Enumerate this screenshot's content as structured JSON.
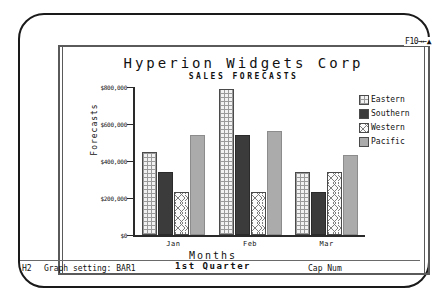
{
  "fkey_hint": "F10→←▲",
  "chart_data": {
    "type": "bar",
    "title": "Hyperion  Widgets  Corp",
    "subtitle": "SALES  FORECASTS",
    "xlabel": "Months",
    "xsublabel": "1st Quarter",
    "ylabel": "Forecasts",
    "categories": [
      "Jan",
      "Feb",
      "Mar"
    ],
    "ylim": [
      0,
      800000
    ],
    "yticks": [
      0,
      200000,
      400000,
      600000,
      800000
    ],
    "ytick_labels": [
      "$0",
      "$200,000",
      "$400,000",
      "$600,000",
      "$800,000"
    ],
    "grid": false,
    "legend_position": "right",
    "series": [
      {
        "name": "Eastern",
        "pattern": "checker",
        "color": "#f2f2f2",
        "values": [
          450000,
          790000,
          340000
        ]
      },
      {
        "name": "Southern",
        "pattern": "solid-dark",
        "color": "#3b3b3b",
        "values": [
          340000,
          540000,
          230000
        ]
      },
      {
        "name": "Western",
        "pattern": "chevron",
        "color": "#fbfbfb",
        "values": [
          230000,
          230000,
          340000
        ]
      },
      {
        "name": "Pacific",
        "pattern": "solid-gray",
        "color": "#ababab",
        "values": [
          540000,
          560000,
          430000
        ]
      }
    ]
  },
  "status": {
    "cell": "H2",
    "setting": "Graph setting: BAR1",
    "indicators": "Cap Num"
  }
}
